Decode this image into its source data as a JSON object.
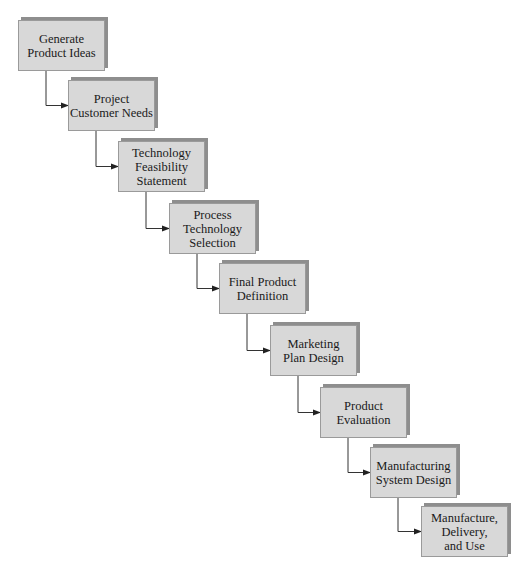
{
  "diagram": {
    "type": "staircase-flowchart",
    "steps": [
      {
        "label": "Generate\nProduct Ideas",
        "x": 18,
        "y": 20
      },
      {
        "label": "Project\nCustomer Needs",
        "x": 68,
        "y": 80
      },
      {
        "label": "Technology\nFeasibility\nStatement",
        "x": 118,
        "y": 141
      },
      {
        "label": "Process\nTechnology\nSelection",
        "x": 169,
        "y": 203
      },
      {
        "label": "Final Product\nDefinition",
        "x": 219,
        "y": 263
      },
      {
        "label": "Marketing\nPlan Design",
        "x": 270,
        "y": 325
      },
      {
        "label": "Product\nEvaluation",
        "x": 320,
        "y": 387
      },
      {
        "label": "Manufacturing\nSystem Design",
        "x": 370,
        "y": 447
      },
      {
        "label": "Manufacture,\nDelivery,\nand Use",
        "x": 421,
        "y": 506
      }
    ],
    "colors": {
      "box_fill": "#d8d8d8",
      "box_border": "#9a9a9a",
      "shadow": "#8e8e8e",
      "line": "#333333"
    }
  }
}
